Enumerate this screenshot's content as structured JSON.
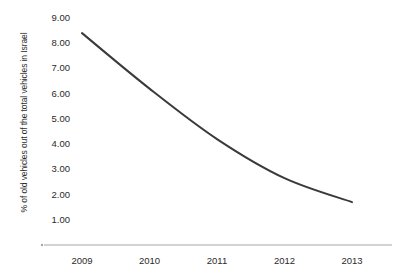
{
  "chart_data": {
    "type": "line",
    "title": "",
    "xlabel": "",
    "ylabel": "% of old vehicles out of the total vehicles in Israel",
    "categories": [
      "2009",
      "2010",
      "2011",
      "2012",
      "2013"
    ],
    "values": [
      8.4,
      6.2,
      4.2,
      2.65,
      1.7
    ],
    "series": [
      {
        "name": "% of old vehicles out of the total vehicles in Israel",
        "values": [
          8.4,
          6.2,
          4.2,
          2.65,
          1.7
        ]
      }
    ],
    "ylim": [
      0,
      9
    ],
    "xlim": [
      "2009",
      "2013"
    ],
    "y_ticks": [
      "1.00",
      "2.00",
      "3.00",
      "4.00",
      "5.00",
      "6.00",
      "7.00",
      "8.00",
      "9.00"
    ],
    "y_tick_values": [
      1,
      2,
      3,
      4,
      5,
      6,
      7,
      8,
      9
    ],
    "x_ticks": [
      "2009",
      "2010",
      "2011",
      "2012",
      "2013"
    ],
    "grid": false,
    "legend": false,
    "legend_position": "none",
    "line_color": "#3a3a3a",
    "axis_color": "#a6a6a6",
    "background_color": "#ffffff",
    "markers": false,
    "smooth": true
  }
}
